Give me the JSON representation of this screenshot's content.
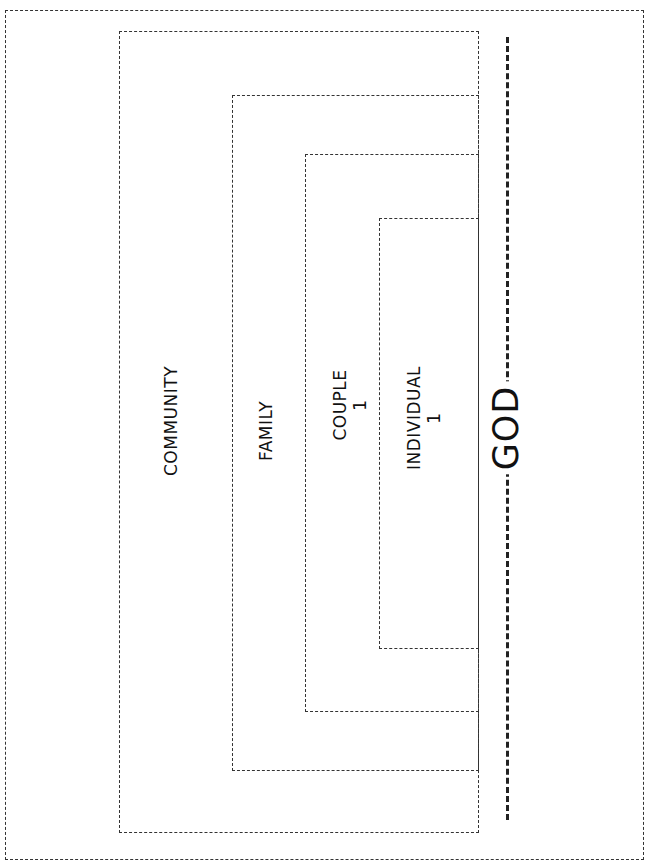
{
  "diagram": {
    "type": "nested-boxes",
    "levels": [
      {
        "id": "community",
        "label": "COMMUNITY",
        "count": null
      },
      {
        "id": "family",
        "label": "FAMILY",
        "count": null
      },
      {
        "id": "couple",
        "label": "COUPLE",
        "count": "1"
      },
      {
        "id": "individual",
        "label": "INDIVIDUAL",
        "count": "1"
      }
    ],
    "axis_label": "GOD",
    "colors": {
      "stroke": "#333333",
      "text": "#111111",
      "background": "#ffffff"
    }
  }
}
